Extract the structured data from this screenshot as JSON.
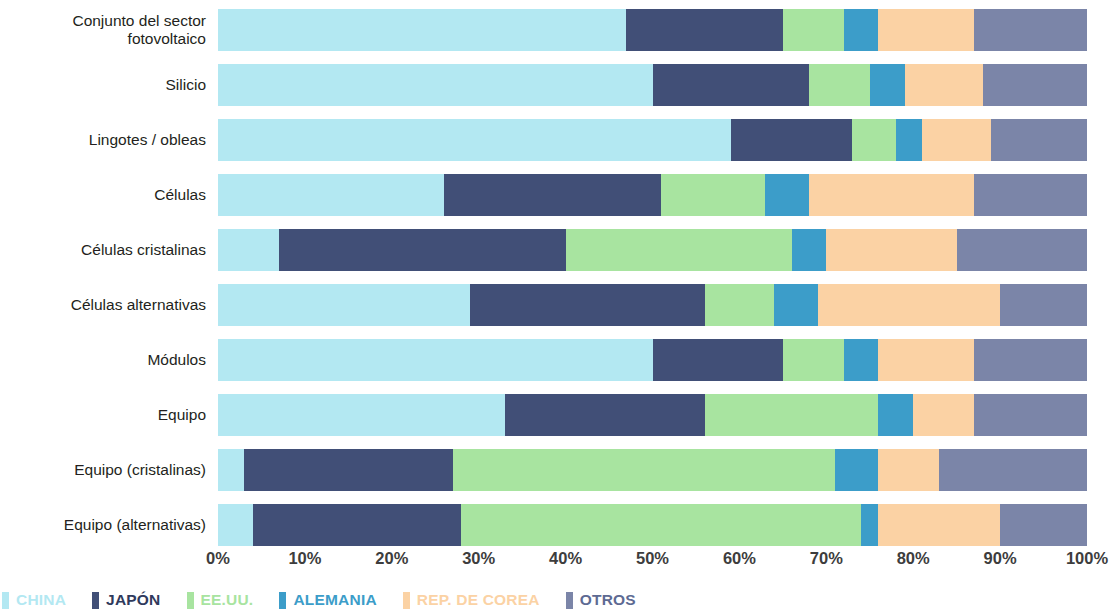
{
  "chart_data": {
    "type": "bar",
    "orientation": "horizontal",
    "stacked": true,
    "stack_total": 100,
    "title": "",
    "subtitle": "",
    "xlabel": "",
    "ylabel": "",
    "xlim": [
      0,
      100
    ],
    "xtick_labels": [
      "0%",
      "10%",
      "20%",
      "30%",
      "40%",
      "50%",
      "60%",
      "70%",
      "80%",
      "90%",
      "100%"
    ],
    "xticks": [
      0,
      10,
      20,
      30,
      40,
      50,
      60,
      70,
      80,
      90,
      100
    ],
    "grid": false,
    "legend_position": "bottom",
    "categories": [
      "Conjunto del sector\nfotovoltaico",
      "Silicio",
      "Lingotes / obleas",
      "Células",
      "Células cristalinas",
      "Células alternativas",
      "Módulos",
      "Equipo",
      "Equipo (cristalinas)",
      "Equipo (alternativas)"
    ],
    "series": [
      {
        "name": "CHINA",
        "color": "#b3e8f2",
        "values": [
          47,
          50,
          59,
          26,
          7,
          29,
          50,
          33,
          3,
          4
        ]
      },
      {
        "name": "JAPÓN",
        "color": "#414f77",
        "values": [
          18,
          18,
          14,
          25,
          33,
          27,
          15,
          23,
          24,
          24
        ]
      },
      {
        "name": "EE.UU.",
        "color": "#a8e4a0",
        "values": [
          7,
          7,
          5,
          12,
          26,
          8,
          7,
          20,
          44,
          46
        ]
      },
      {
        "name": "ALEMANIA",
        "color": "#3c9dc9",
        "values": [
          4,
          4,
          3,
          5,
          4,
          5,
          4,
          4,
          5,
          2
        ]
      },
      {
        "name": "REP. DE COREA",
        "color": "#fbd2a4",
        "values": [
          11,
          9,
          8,
          19,
          15,
          21,
          11,
          7,
          7,
          14
        ]
      },
      {
        "name": "OTROS",
        "color": "#7b85a8",
        "values": [
          13,
          12,
          11,
          13,
          15,
          10,
          13,
          13,
          17,
          10
        ]
      }
    ]
  },
  "legend": {
    "items": [
      {
        "label": "CHINA",
        "color": "#b3e8f2",
        "text_color": "#b3e8f2"
      },
      {
        "label": "JAPÓN",
        "color": "#414f77",
        "text_color": "#2f3a5c"
      },
      {
        "label": "EE.UU.",
        "color": "#a8e4a0",
        "text_color": "#a8e4a0"
      },
      {
        "label": "ALEMANIA",
        "color": "#3c9dc9",
        "text_color": "#3c9dc9"
      },
      {
        "label": "REP. DE COREA",
        "color": "#fbd2a4",
        "text_color": "#fbd2a4"
      },
      {
        "label": "OTROS",
        "color": "#7b85a8",
        "text_color": "#5d6a93"
      }
    ]
  }
}
